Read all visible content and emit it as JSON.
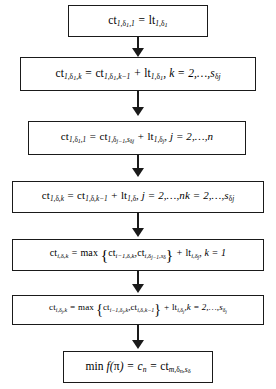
{
  "diagram": {
    "type": "flowchart",
    "orientation": "vertical",
    "colors": {
      "box_border": "#1a1a1a",
      "box_fill": "#ffffff",
      "arrow": "#1a1a1a",
      "text": "#000000",
      "background": "#ffffff"
    },
    "nodes": [
      {
        "id": "node-1",
        "index": 1,
        "formula_text": "ct_{1,δ1,1} = lt_{1,δ1}",
        "plain": "ct(1,δ1,1) = lt(1,δ1)"
      },
      {
        "id": "node-2",
        "index": 2,
        "formula_text": "ct_{1,δ1,k} = ct_{1,δ1,k-1} + lt_{1,δ1}, k = 2,…,s_{δj}",
        "plain": "ct(1,δ1,k) = ct(1,δ1,k-1) + lt(1,δ1), k = 2,...,s(δj)"
      },
      {
        "id": "node-3",
        "index": 3,
        "formula_text": "ct_{1,δj,1} = ct_{1,δj-1,s_{δj}} + lt_{1,δj}, j = 2,…,n",
        "plain": "ct(1,δj,1) = ct(1,δj-1,s(δj)) + lt(1,δj), j = 2,...,n"
      },
      {
        "id": "node-4",
        "index": 4,
        "formula_text": "ct_{1,δ,k} = ct_{1,δ,k-1} + lt_{1,δ}, j = 2,…,nk = 2,…,s_{δj}",
        "plain": "ct(1,δ,k) = ct(1,δ,k-1) + lt(1,δ), j = 2,...,nk = 2,...,s(δj)"
      },
      {
        "id": "node-5",
        "index": 5,
        "formula_text": "ct_{i,δ,k} = max{ ct_{i-1,δ,k}, ct_{i,δj-1,s_δ} } + lt_{i,δj}, k = 1",
        "plain": "ct(i,δ,k) = max{ct(i-1,δ,k), ct(i,δj-1,s(δ))} + lt(i,δj), k = 1"
      },
      {
        "id": "node-6",
        "index": 6,
        "formula_text": "ct_{i,δj,k} = max{ ct_{i-1,δj,k}, ct_{i,δ,k-1} } + lt_{i,δj}, k = 2,…,s_{δj}",
        "plain": "ct(i,δj,k) = max{ct(i-1,δj,k), ct(i,δ,k-1)} + lt(i,δj), k = 2,...,s(δj)"
      },
      {
        "id": "node-7",
        "index": 7,
        "formula_text": "min f(π) = c_n = ct_{m,δn,s_δ}",
        "plain": "min f(pi) = c(n) = ct(m,δn,s(δ))"
      }
    ],
    "edges": [
      {
        "from": "node-1",
        "to": "node-2",
        "marker": "arrow-down"
      },
      {
        "from": "node-2",
        "to": "node-3",
        "marker": "arrow-down"
      },
      {
        "from": "node-3",
        "to": "node-4",
        "marker": "arrow-down"
      },
      {
        "from": "node-4",
        "to": "node-5",
        "marker": "arrow-down"
      },
      {
        "from": "node-5",
        "to": "node-6",
        "marker": "arrow-down"
      },
      {
        "from": "node-6",
        "to": "node-7",
        "marker": "arrow-down"
      }
    ]
  }
}
